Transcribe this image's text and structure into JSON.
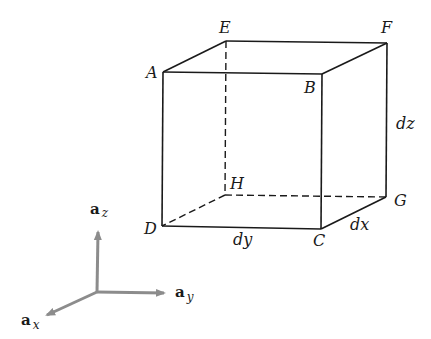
{
  "diagram": {
    "colors": {
      "edge": "#1a1a1a",
      "axis": "#8c8c8c",
      "background": "#ffffff"
    },
    "vertices": {
      "A": {
        "label": "A",
        "x": 163,
        "y": 72
      },
      "B": {
        "label": "B",
        "x": 322,
        "y": 74
      },
      "C": {
        "label": "C",
        "x": 321,
        "y": 229
      },
      "D": {
        "label": "D",
        "x": 162,
        "y": 226
      },
      "E": {
        "label": "E",
        "x": 226,
        "y": 41
      },
      "F": {
        "label": "F",
        "x": 387,
        "y": 43
      },
      "G": {
        "label": "G",
        "x": 386,
        "y": 197
      },
      "H": {
        "label": "H",
        "x": 225,
        "y": 195
      }
    },
    "edges_solid": [
      "AB",
      "BC",
      "CD",
      "DA",
      "AE",
      "EF",
      "FB",
      "FG",
      "GC"
    ],
    "edges_dashed": [
      "EH",
      "HD",
      "HG"
    ],
    "dimensions": {
      "dx": "dx",
      "dy": "dy",
      "dz": "dz"
    },
    "axes": {
      "z": {
        "base": "a",
        "sub": "z"
      },
      "y": {
        "base": "a",
        "sub": "y"
      },
      "x": {
        "base": "a",
        "sub": "x"
      }
    }
  }
}
